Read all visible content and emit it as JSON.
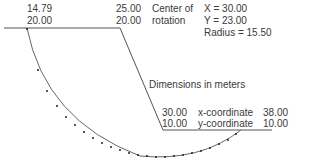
{
  "diagram": {
    "units_note": "Dimensions in meters",
    "center_of_rotation": {
      "label_line1": "Center of",
      "label_line2": "rotation",
      "x_text": "X = 30.00",
      "y_text": "Y = 23.00",
      "radius_text": "Radius = 15.50"
    },
    "points": {
      "arc_entry": {
        "x": "14.79",
        "y": "20.00"
      },
      "crest": {
        "x": "25.00",
        "y": "20.00"
      },
      "toe": {
        "x": "30.00",
        "y": "10.00"
      },
      "arc_exit": {
        "x": "38.00",
        "y": "10.00"
      }
    },
    "axis_labels": {
      "x": "x-coordinate",
      "y": "y-coordinate"
    },
    "colors": {
      "line": "#555555",
      "text": "#3a3a3a",
      "dots": "#222222"
    }
  }
}
